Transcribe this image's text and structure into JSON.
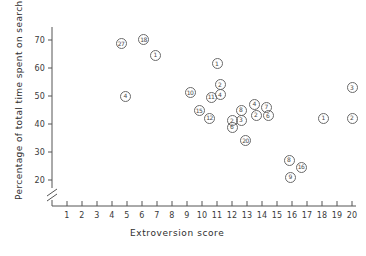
{
  "chart_data": {
    "type": "scatter",
    "title": "",
    "xlabel": "Extroversion score",
    "ylabel": "Percentage of total time spent on search",
    "xlim": [
      0,
      20.8
    ],
    "ylim": [
      17,
      75
    ],
    "xticks": [
      1,
      2,
      3,
      4,
      5,
      6,
      7,
      8,
      9,
      10,
      11,
      12,
      13,
      14,
      15,
      16,
      17,
      18,
      19,
      20
    ],
    "yticks": [
      20,
      30,
      40,
      50,
      60,
      70
    ],
    "grid": false,
    "legend": false,
    "axis_break": {
      "axis": "y",
      "below": 20,
      "symbol": "//"
    },
    "point_labels": "subject id inside circle marker",
    "points": [
      {
        "label": "27",
        "x": 4.6,
        "y": 68.7
      },
      {
        "label": "18",
        "x": 6.1,
        "y": 70.1
      },
      {
        "label": "1",
        "x": 6.9,
        "y": 64.6
      },
      {
        "label": "4",
        "x": 4.9,
        "y": 50.0
      },
      {
        "label": "1",
        "x": 11.0,
        "y": 61.5
      },
      {
        "label": "10",
        "x": 9.2,
        "y": 51.2
      },
      {
        "label": "2",
        "x": 11.2,
        "y": 54.0
      },
      {
        "label": "4",
        "x": 11.2,
        "y": 50.4
      },
      {
        "label": "11",
        "x": 10.6,
        "y": 49.5
      },
      {
        "label": "15",
        "x": 9.8,
        "y": 44.8
      },
      {
        "label": "12",
        "x": 10.5,
        "y": 42.1
      },
      {
        "label": "8",
        "x": 12.6,
        "y": 45.0
      },
      {
        "label": "4",
        "x": 13.5,
        "y": 47.0
      },
      {
        "label": "7",
        "x": 14.3,
        "y": 46.0
      },
      {
        "label": "2",
        "x": 13.6,
        "y": 43.2
      },
      {
        "label": "6",
        "x": 14.4,
        "y": 43.0
      },
      {
        "label": "2",
        "x": 12.0,
        "y": 41.1
      },
      {
        "label": "3",
        "x": 12.6,
        "y": 41.3
      },
      {
        "label": "6",
        "x": 12.0,
        "y": 38.8
      },
      {
        "label": "20",
        "x": 12.9,
        "y": 34.0
      },
      {
        "label": "8",
        "x": 15.8,
        "y": 27.0
      },
      {
        "label": "16",
        "x": 16.6,
        "y": 24.5
      },
      {
        "label": "9",
        "x": 15.9,
        "y": 21.0
      },
      {
        "label": "1",
        "x": 18.1,
        "y": 42.0
      },
      {
        "label": "2",
        "x": 20.0,
        "y": 42.0
      },
      {
        "label": "3",
        "x": 20.0,
        "y": 53.0
      }
    ]
  },
  "axis_break_glyph": "//"
}
